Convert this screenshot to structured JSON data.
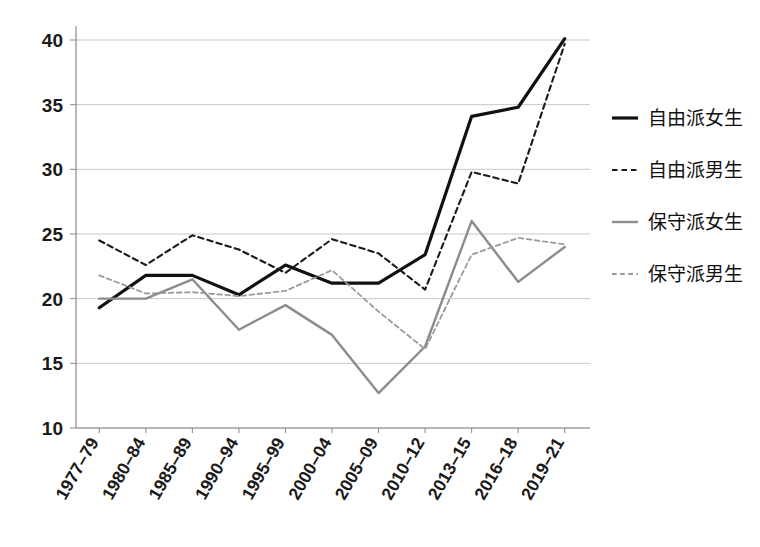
{
  "chart_data": {
    "type": "line",
    "title": "",
    "subtitle": "",
    "xlabel": "",
    "ylabel": "",
    "ylim": [
      10,
      40
    ],
    "yticks": [
      10,
      15,
      20,
      25,
      30,
      35,
      40
    ],
    "grid": true,
    "legend_position": "right",
    "categories": [
      "1977–79",
      "1980–84",
      "1985–89",
      "1990–94",
      "1995–99",
      "2000–04",
      "2005–09",
      "2010–12",
      "2013–15",
      "2016–18",
      "2019–21"
    ],
    "series": [
      {
        "name": "自由派女生",
        "style": "solid",
        "color": "#111111",
        "width": 3.2,
        "values": [
          19.3,
          21.8,
          21.8,
          20.3,
          22.6,
          21.2,
          21.2,
          23.4,
          34.1,
          34.8,
          40.1
        ]
      },
      {
        "name": "自由派男生",
        "style": "dashed",
        "color": "#1a1a1a",
        "width": 2.1,
        "values": [
          24.5,
          22.6,
          24.9,
          23.8,
          22.0,
          24.6,
          23.5,
          20.7,
          29.8,
          28.9,
          39.7
        ]
      },
      {
        "name": "保守派女生",
        "style": "solid",
        "color": "#8c8c8c",
        "width": 2.4,
        "values": [
          20.0,
          20.0,
          21.5,
          17.6,
          19.5,
          17.2,
          12.7,
          16.3,
          26.0,
          21.3,
          24.0
        ]
      },
      {
        "name": "保守派男生",
        "style": "dashed",
        "color": "#9a9a9a",
        "width": 1.8,
        "values": [
          21.8,
          20.4,
          20.5,
          20.2,
          20.6,
          22.2,
          19.0,
          16.1,
          23.4,
          24.7,
          24.2
        ]
      }
    ]
  },
  "legend": {
    "items": [
      {
        "label": "自由派女生",
        "swatch": "thick-solid-black-line-icon"
      },
      {
        "label": "自由派男生",
        "swatch": "dashed-black-line-icon"
      },
      {
        "label": "保守派女生",
        "swatch": "solid-gray-line-icon"
      },
      {
        "label": "保守派男生",
        "swatch": "dashed-gray-line-icon"
      }
    ]
  }
}
